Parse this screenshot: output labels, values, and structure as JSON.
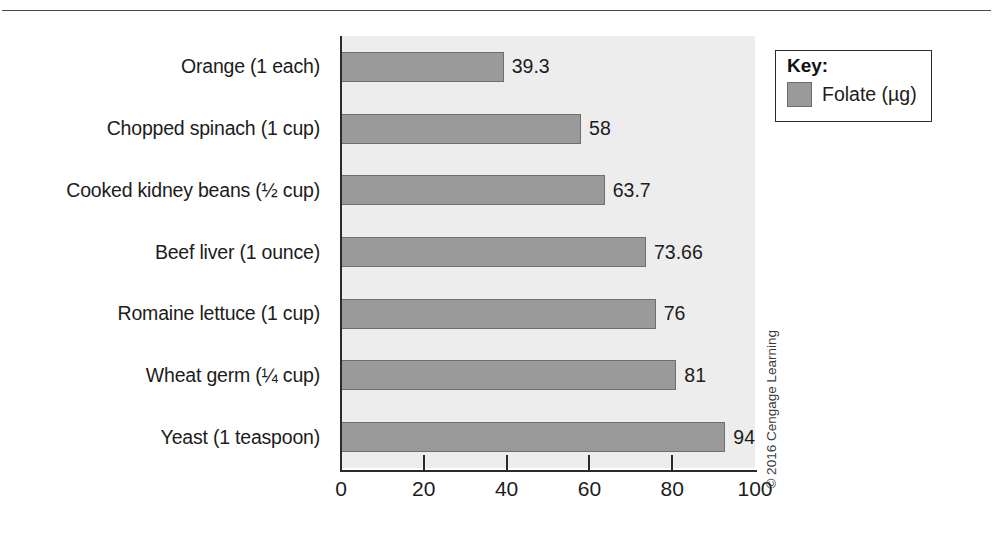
{
  "figure": {
    "credit": "© 2016 Cengage Learning"
  },
  "legend": {
    "title": "Key:",
    "entries": [
      {
        "label": "Folate (µg)",
        "color": "#9a9a9a"
      }
    ]
  },
  "chart_data": {
    "type": "bar",
    "orientation": "horizontal",
    "title": "",
    "xlabel": "",
    "ylabel": "",
    "xlim": [
      0,
      100
    ],
    "xticks": [
      0,
      20,
      40,
      60,
      80,
      100
    ],
    "grid": false,
    "legend_position": "top-right",
    "series_name": "Folate (µg)",
    "bar_color": "#9a9a9a",
    "plot_background": "#ededed",
    "categories": [
      "Orange (1 each)",
      "Chopped spinach (1 cup)",
      "Cooked kidney beans (½ cup)",
      "Beef liver (1 ounce)",
      "Romaine lettuce (1 cup)",
      "Wheat germ (¼ cup)",
      "Yeast (1 teaspoon)"
    ],
    "values": [
      39.3,
      58,
      63.7,
      73.66,
      76,
      81,
      94
    ],
    "value_labels": [
      "39.3",
      "58",
      "63.7",
      "73.66",
      "76",
      "81",
      "94"
    ]
  }
}
